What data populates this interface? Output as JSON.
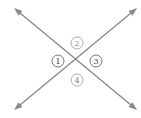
{
  "diagram": {
    "line_color": "#8a8a8a",
    "lines": [
      {
        "name": "line-a",
        "from": [
          14,
          8
        ],
        "to": [
          137,
          110
        ],
        "arrows": "both"
      },
      {
        "name": "line-b",
        "from": [
          137,
          8
        ],
        "to": [
          14,
          110
        ],
        "arrows": "both"
      }
    ],
    "intersection": [
      77,
      61
    ],
    "angles": [
      {
        "label": "1",
        "position": "left",
        "cx": 58,
        "cy": 61,
        "style": "dark"
      },
      {
        "label": "2",
        "position": "top",
        "cx": 77,
        "cy": 43,
        "style": "light"
      },
      {
        "label": "3",
        "position": "right",
        "cx": 96,
        "cy": 61,
        "style": "dark"
      },
      {
        "label": "4",
        "position": "bottom",
        "cx": 77,
        "cy": 80,
        "style": "light"
      }
    ]
  }
}
